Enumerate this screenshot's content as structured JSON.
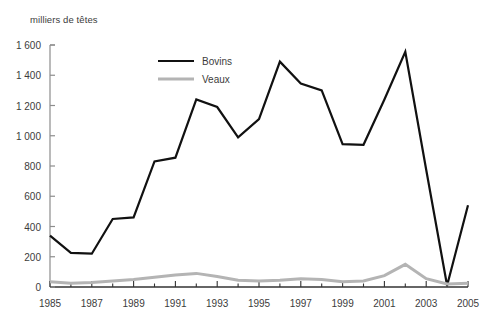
{
  "chart_data": {
    "type": "line",
    "title": "",
    "ylabel": "milliers de têtes",
    "xlabel": "",
    "ylim": [
      0,
      1600
    ],
    "xlim": [
      1985,
      2005
    ],
    "grid": false,
    "legend_position": "top-center",
    "y_ticks": [
      "0",
      "200",
      "400",
      "600",
      "800",
      "1 000",
      "1 200",
      "1 400",
      "1 600"
    ],
    "y_tick_values": [
      0,
      200,
      400,
      600,
      800,
      1000,
      1200,
      1400,
      1600
    ],
    "x_ticks": [
      "1985",
      "1987",
      "1989",
      "1991",
      "1993",
      "1995",
      "1997",
      "1999",
      "2001",
      "2003",
      "2005"
    ],
    "x_tick_values": [
      1985,
      1987,
      1989,
      1991,
      1993,
      1995,
      1997,
      1999,
      2001,
      2003,
      2005
    ],
    "x": [
      1985,
      1986,
      1987,
      1988,
      1989,
      1990,
      1991,
      1992,
      1993,
      1994,
      1995,
      1996,
      1997,
      1998,
      1999,
      2000,
      2001,
      2002,
      2003,
      2004,
      2005
    ],
    "series": [
      {
        "name": "Bovins",
        "color": "#111111",
        "width": 2.2,
        "values": [
          340,
          225,
          220,
          450,
          460,
          830,
          855,
          1240,
          1190,
          990,
          1110,
          1490,
          1345,
          1300,
          945,
          940,
          1240,
          1555,
          775,
          10,
          540
        ]
      },
      {
        "name": "Veaux",
        "color": "#b4b4b4",
        "width": 3.0,
        "values": [
          35,
          25,
          30,
          40,
          50,
          65,
          80,
          90,
          70,
          45,
          40,
          45,
          55,
          50,
          35,
          40,
          75,
          150,
          55,
          20,
          25
        ]
      }
    ]
  },
  "legend": {
    "items": [
      {
        "label": "Bovins",
        "color": "#111111"
      },
      {
        "label": "Veaux",
        "color": "#b4b4b4"
      }
    ]
  }
}
